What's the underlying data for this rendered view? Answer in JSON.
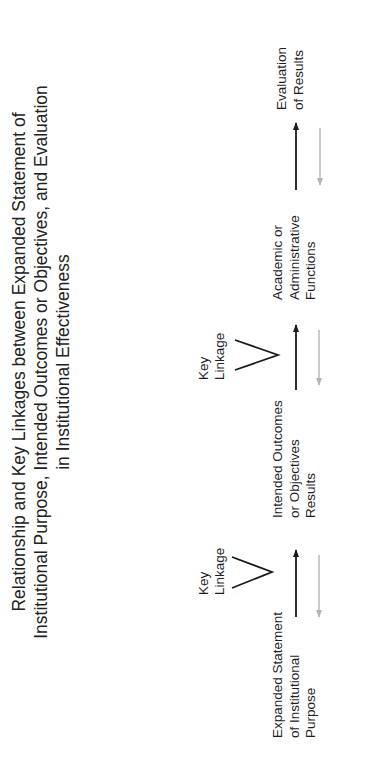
{
  "title": {
    "lines": [
      "Relationship and Key Linkages between Expanded Statement of",
      "Institutional Purpose, Intended Outcomes or Objectives, and Evaluation",
      "in Institutional Effectiveness"
    ]
  },
  "nodes": [
    {
      "id": "expanded-statement",
      "lines": [
        "Expanded Statement",
        "of Institutional",
        "Purpose"
      ]
    },
    {
      "id": "intended-outcomes",
      "lines": [
        "Intended Outcomes",
        "or Objectives",
        "Results"
      ]
    },
    {
      "id": "academic-functions",
      "lines": [
        "Academic or",
        "Administrative",
        "Functions"
      ]
    },
    {
      "id": "evaluation",
      "lines": [
        "Evaluation",
        "of Results"
      ]
    }
  ],
  "key_linkages": [
    {
      "lines": [
        "Key",
        "Linkage"
      ],
      "between": [
        "expanded-statement",
        "intended-outcomes"
      ]
    },
    {
      "lines": [
        "Key",
        "Linkage"
      ],
      "between": [
        "intended-outcomes",
        "academic-functions"
      ]
    }
  ],
  "colors": {
    "forward_arrow": "#1a1a1a",
    "feedback_arrow": "#b4b4b4",
    "text": "#1e1e1e",
    "background": "#ffffff"
  },
  "orientation": "rotated 90 degrees counterclockwise"
}
